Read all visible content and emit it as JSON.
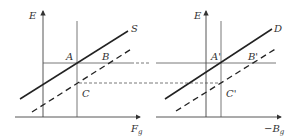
{
  "left_panel": {
    "y_axis_label": "E",
    "x_axis_label": "F",
    "x_axis_sub": "g",
    "curve_label": "S",
    "points": {
      "a": "A",
      "b": "B",
      "c": "C"
    }
  },
  "right_panel": {
    "y_axis_label": "E",
    "x_axis_label": "−B",
    "x_axis_sub": "g",
    "curve_label": "D",
    "points": {
      "a": "A'",
      "b": "B'",
      "c": "C'"
    }
  },
  "colors": {
    "line": "#2a2a2a",
    "thin": "#555555"
  }
}
